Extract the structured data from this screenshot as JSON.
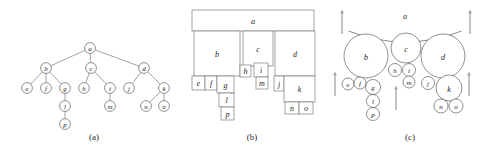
{
  "figure": {
    "panels": [
      {
        "id": "a",
        "caption": "(a)",
        "kind": "node-link-tree"
      },
      {
        "id": "b",
        "caption": "(b)",
        "kind": "nested-rectangles"
      },
      {
        "id": "c",
        "caption": "(c)",
        "kind": "circle-packing"
      }
    ]
  },
  "captions": {
    "a": "(a)",
    "b": "(b)",
    "c": "(c)"
  },
  "tree": {
    "root": "a",
    "nodes": [
      "a",
      "b",
      "c",
      "d",
      "e",
      "f",
      "g",
      "h",
      "i",
      "j",
      "k",
      "l",
      "m",
      "n",
      "o",
      "p"
    ],
    "edges": [
      [
        "a",
        "b"
      ],
      [
        "a",
        "c"
      ],
      [
        "a",
        "d"
      ],
      [
        "b",
        "e"
      ],
      [
        "b",
        "f"
      ],
      [
        "b",
        "g"
      ],
      [
        "c",
        "h"
      ],
      [
        "c",
        "i"
      ],
      [
        "d",
        "j"
      ],
      [
        "d",
        "k"
      ],
      [
        "g",
        "l"
      ],
      [
        "l",
        "p"
      ],
      [
        "i",
        "m"
      ],
      [
        "k",
        "n"
      ],
      [
        "k",
        "o"
      ]
    ]
  },
  "panel_a": {
    "caption": "(a)",
    "nodes": [
      {
        "label": "a",
        "cx": 90,
        "cy": 48,
        "r": 5.4
      },
      {
        "label": "b",
        "cx": 46,
        "cy": 68,
        "r": 5.4
      },
      {
        "label": "c",
        "cx": 91,
        "cy": 68,
        "r": 5.4
      },
      {
        "label": "d",
        "cx": 144,
        "cy": 68,
        "r": 5.4
      },
      {
        "label": "e",
        "cx": 27,
        "cy": 88,
        "r": 5.4
      },
      {
        "label": "f",
        "cx": 46,
        "cy": 88,
        "r": 5.4
      },
      {
        "label": "g",
        "cx": 65,
        "cy": 88,
        "r": 5.4
      },
      {
        "label": "h",
        "cx": 84,
        "cy": 88,
        "r": 5.4
      },
      {
        "label": "i",
        "cx": 110,
        "cy": 88,
        "r": 5.4
      },
      {
        "label": "j",
        "cx": 129,
        "cy": 88,
        "r": 5.4
      },
      {
        "label": "k",
        "cx": 164,
        "cy": 88,
        "r": 5.4
      },
      {
        "label": "l",
        "cx": 65,
        "cy": 106,
        "r": 5.4
      },
      {
        "label": "m",
        "cx": 110,
        "cy": 106,
        "r": 5.4
      },
      {
        "label": "n",
        "cx": 146,
        "cy": 106,
        "r": 5.4
      },
      {
        "label": "o",
        "cx": 164,
        "cy": 106,
        "r": 5.4
      },
      {
        "label": "p",
        "cx": 65,
        "cy": 124,
        "r": 5.4
      }
    ]
  },
  "panel_b": {
    "caption": "(b)",
    "boxes": [
      {
        "label": "a",
        "x": 192,
        "y": 10,
        "w": 122,
        "h": 21
      },
      {
        "label": "b",
        "x": 194,
        "y": 31,
        "w": 46,
        "h": 45
      },
      {
        "label": "c",
        "x": 243,
        "y": 31,
        "w": 30,
        "h": 35
      },
      {
        "label": "d",
        "x": 275,
        "y": 31,
        "w": 40,
        "h": 45
      },
      {
        "label": "e",
        "x": 192,
        "y": 76,
        "w": 13,
        "h": 14
      },
      {
        "label": "f",
        "x": 205,
        "y": 76,
        "w": 12,
        "h": 14
      },
      {
        "label": "g",
        "x": 217,
        "y": 76,
        "w": 17,
        "h": 17
      },
      {
        "label": "h",
        "x": 240,
        "y": 65,
        "w": 11,
        "h": 12
      },
      {
        "label": "i",
        "x": 254,
        "y": 63,
        "w": 14,
        "h": 14
      },
      {
        "label": "j",
        "x": 274,
        "y": 76,
        "w": 10,
        "h": 15
      },
      {
        "label": "k",
        "x": 284,
        "y": 76,
        "w": 31,
        "h": 26
      },
      {
        "label": "l",
        "x": 219,
        "y": 93,
        "w": 15,
        "h": 14
      },
      {
        "label": "m",
        "x": 256,
        "y": 77,
        "w": 12,
        "h": 12
      },
      {
        "label": "n",
        "x": 285,
        "y": 102,
        "w": 14,
        "h": 12
      },
      {
        "label": "o",
        "x": 299,
        "y": 102,
        "w": 14,
        "h": 12
      },
      {
        "label": "p",
        "x": 221,
        "y": 107,
        "w": 13,
        "h": 13
      }
    ]
  },
  "panel_c": {
    "caption": "(c)",
    "root_arc": {
      "label": "a",
      "cx": 405,
      "cy": -108,
      "r": 150
    },
    "root_label_pos": {
      "x": 405,
      "y": 19
    },
    "circles": [
      {
        "label": "b",
        "cx": 366,
        "cy": 56,
        "r": 22
      },
      {
        "label": "c",
        "cx": 406,
        "cy": 48,
        "r": 15
      },
      {
        "label": "d",
        "cx": 443,
        "cy": 56,
        "r": 22
      },
      {
        "label": "e",
        "cx": 348,
        "cy": 84,
        "r": 6
      },
      {
        "label": "f",
        "cx": 360,
        "cy": 83,
        "r": 6
      },
      {
        "label": "g",
        "cx": 373,
        "cy": 87,
        "r": 7.5
      },
      {
        "label": "h",
        "cx": 395,
        "cy": 70,
        "r": 6.5
      },
      {
        "label": "i",
        "cx": 409,
        "cy": 70,
        "r": 6.5
      },
      {
        "label": "j",
        "cx": 428,
        "cy": 83,
        "r": 6.5
      },
      {
        "label": "k",
        "cx": 449,
        "cy": 88,
        "r": 13
      },
      {
        "label": "l",
        "cx": 373,
        "cy": 101,
        "r": 6.5
      },
      {
        "label": "m",
        "cx": 409,
        "cy": 82,
        "r": 6
      },
      {
        "label": "n",
        "cx": 441,
        "cy": 106,
        "r": 7
      },
      {
        "label": "o",
        "cx": 456,
        "cy": 106,
        "r": 7
      },
      {
        "label": "p",
        "cx": 373,
        "cy": 114,
        "r": 6.5
      }
    ],
    "arrows": [
      {
        "x": 342,
        "y_tail": 34,
        "y_head": 12
      },
      {
        "x": 470,
        "y_tail": 34,
        "y_head": 12
      },
      {
        "x": 335,
        "y_tail": 96,
        "y_head": 74
      },
      {
        "x": 396,
        "y_tail": 110,
        "y_head": 88
      },
      {
        "x": 469,
        "y_tail": 96,
        "y_head": 74
      }
    ]
  },
  "colors": {
    "background": "#ffffff",
    "stroke": "#555555",
    "label": "#1c1c1c",
    "caption": "#2a2a2a"
  }
}
